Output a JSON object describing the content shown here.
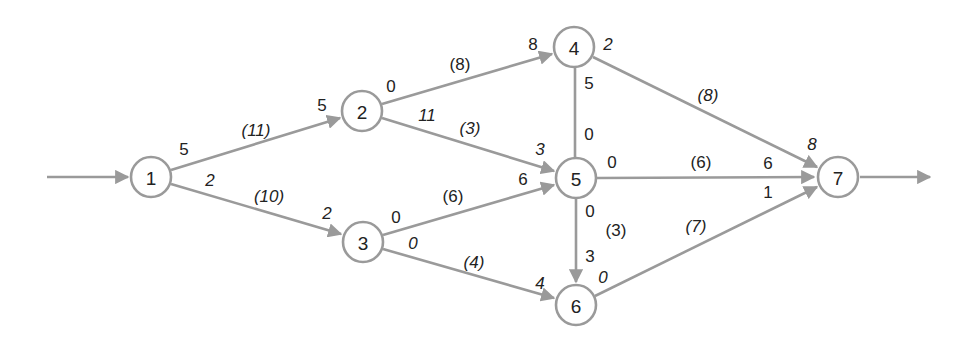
{
  "diagram": {
    "type": "activity-on-arrow network",
    "colors": {
      "edge": "#9a9a9a",
      "node_stroke": "#9a9a9a",
      "text": "#222222",
      "background": "#ffffff"
    },
    "nodes": [
      {
        "id": "1",
        "label": "1",
        "x": 151,
        "y": 177
      },
      {
        "id": "2",
        "label": "2",
        "x": 362,
        "y": 111
      },
      {
        "id": "3",
        "label": "3",
        "x": 363,
        "y": 242
      },
      {
        "id": "4",
        "label": "4",
        "x": 574,
        "y": 47
      },
      {
        "id": "5",
        "label": "5",
        "x": 576,
        "y": 178
      },
      {
        "id": "6",
        "label": "6",
        "x": 576,
        "y": 305
      },
      {
        "id": "7",
        "label": "7",
        "x": 838,
        "y": 177
      }
    ],
    "edges": [
      {
        "from": "1",
        "to": "2",
        "duration": "(11)",
        "start_value": "5",
        "end_value": "5"
      },
      {
        "from": "1",
        "to": "3",
        "duration": "(10)",
        "start_value": "2",
        "end_value": "2"
      },
      {
        "from": "2",
        "to": "4",
        "duration": "(8)",
        "start_value": "0",
        "end_value": "8"
      },
      {
        "from": "2",
        "to": "5",
        "duration": "(3)",
        "start_value": "11",
        "end_value": "3"
      },
      {
        "from": "3",
        "to": "5",
        "duration": "(6)",
        "start_value": "0",
        "end_value": "6"
      },
      {
        "from": "3",
        "to": "6",
        "duration": "(4)",
        "start_value": "0",
        "end_value": "4"
      },
      {
        "from": "4",
        "to": "5",
        "duration": "",
        "start_value": "5",
        "end_value": "0"
      },
      {
        "from": "4",
        "to": "7",
        "duration": "(8)",
        "start_value": "2",
        "end_value": "8"
      },
      {
        "from": "5",
        "to": "7",
        "duration": "(6)",
        "start_value": "0",
        "end_value": "6"
      },
      {
        "from": "5",
        "to": "6",
        "duration": "(3)",
        "start_value": "0",
        "end_value": "3"
      },
      {
        "from": "6",
        "to": "7",
        "duration": "(7)",
        "start_value": "0",
        "end_value": "1"
      }
    ],
    "entry_arrow": {
      "to": "1"
    },
    "exit_arrow": {
      "from": "7"
    }
  }
}
